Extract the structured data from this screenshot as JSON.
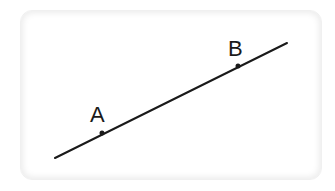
{
  "diagram": {
    "type": "line-through-two-points",
    "line": {
      "start": [
        55,
        158
      ],
      "end": [
        287,
        43
      ],
      "color": "#1a1a1a",
      "width": 2
    },
    "points": [
      {
        "label": "A",
        "x": 102,
        "y": 133,
        "label_x": 90,
        "label_y": 122
      },
      {
        "label": "B",
        "x": 238,
        "y": 66,
        "label_x": 228,
        "label_y": 56
      }
    ],
    "card": {
      "background": "#ffffff",
      "border": "#f0f0f0"
    }
  }
}
